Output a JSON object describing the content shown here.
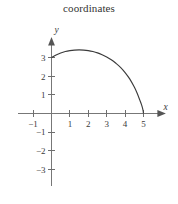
{
  "figure": {
    "title": "coordinates",
    "background_color": "#ffffff",
    "axis_color": "#777777",
    "curve_color": "#3b3b3b",
    "label_color": "#3a3a3a"
  },
  "chart_data": {
    "type": "line",
    "title": "coordinates",
    "xlabel": "x",
    "ylabel": "y",
    "grid": false,
    "legend": "none",
    "xlim": [
      -1.8,
      6.3
    ],
    "ylim": [
      -3.9,
      4.2
    ],
    "xticks": [
      -1,
      1,
      2,
      3,
      4,
      5
    ],
    "xtick_labels": [
      "−1",
      "1",
      "2",
      "3",
      "4",
      "5"
    ],
    "yticks": [
      -3,
      -2,
      -1,
      1,
      2,
      3
    ],
    "ytick_labels": [
      "−3",
      "−2",
      "−1",
      "1",
      "2",
      "3"
    ],
    "annotations": [],
    "series": [
      {
        "name": "arc",
        "x": [
          0.0,
          0.25,
          0.5,
          0.75,
          1.0,
          1.25,
          1.5,
          1.75,
          2.0,
          2.25,
          2.5,
          2.75,
          3.0,
          3.25,
          3.5,
          3.75,
          4.0,
          4.25,
          4.5,
          4.65,
          4.8,
          4.9,
          4.97,
          5.0
        ],
        "y": [
          3.0,
          3.14,
          3.25,
          3.33,
          3.38,
          3.41,
          3.42,
          3.41,
          3.38,
          3.33,
          3.26,
          3.16,
          3.04,
          2.89,
          2.7,
          2.48,
          2.2,
          1.86,
          1.42,
          1.1,
          0.72,
          0.45,
          0.2,
          0.0
        ]
      }
    ]
  },
  "axis_labels": {
    "x_axis_name": "x",
    "y_axis_name": "y"
  }
}
